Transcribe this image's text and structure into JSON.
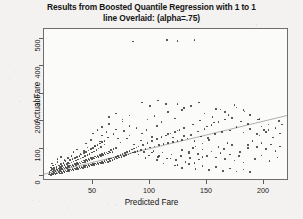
{
  "chart_data": {
    "type": "scatter",
    "title": "Results from Boosted Quantile Regression with 1 to 1 line Overlaid: (alpha=.75)",
    "title_line1": "Results from Boosted Quantile Regression with 1 to 1",
    "title_line2": "line Overlaid: (alpha=.75)",
    "xlabel": "Predicted Fare",
    "ylabel": "Actual Fare",
    "xlim": [
      7,
      222
    ],
    "ylim": [
      -18,
      535
    ],
    "xticks": [
      50,
      100,
      150,
      200
    ],
    "yticks": [
      0,
      100,
      200,
      300,
      400,
      500
    ],
    "grid": false,
    "legend": null,
    "marker_color": "#3a3a3a",
    "line_color": "#9a9a9a",
    "frame_color": "#6e6e6e",
    "background": "#fbfbfa",
    "annotations": [
      {
        "text": "1 to 1 line overlaid",
        "type": "reference-line"
      }
    ],
    "reference_line": {
      "label": "1 to 1 line",
      "x": [
        7,
        222
      ],
      "y": [
        7,
        222
      ],
      "slope": 1,
      "intercept": 0
    },
    "points": [
      [
        11,
        5
      ],
      [
        12,
        8
      ],
      [
        12,
        14
      ],
      [
        13,
        3
      ],
      [
        13,
        20
      ],
      [
        13,
        31
      ],
      [
        14,
        9
      ],
      [
        14,
        25
      ],
      [
        14,
        46
      ],
      [
        15,
        6
      ],
      [
        15,
        17
      ],
      [
        15,
        38
      ],
      [
        16,
        11
      ],
      [
        16,
        22
      ],
      [
        16,
        30
      ],
      [
        17,
        7
      ],
      [
        17,
        19
      ],
      [
        17,
        42
      ],
      [
        18,
        12
      ],
      [
        18,
        26
      ],
      [
        18,
        34
      ],
      [
        19,
        9
      ],
      [
        19,
        21
      ],
      [
        19,
        51
      ],
      [
        20,
        14
      ],
      [
        20,
        28
      ],
      [
        20,
        39
      ],
      [
        21,
        10
      ],
      [
        21,
        23
      ],
      [
        21,
        33
      ],
      [
        22,
        16
      ],
      [
        22,
        29
      ],
      [
        22,
        44
      ],
      [
        23,
        12
      ],
      [
        23,
        25
      ],
      [
        23,
        36
      ],
      [
        24,
        18
      ],
      [
        24,
        31
      ],
      [
        24,
        48
      ],
      [
        25,
        14
      ],
      [
        25,
        27
      ],
      [
        25,
        40
      ],
      [
        26,
        20
      ],
      [
        26,
        34
      ],
      [
        26,
        55
      ],
      [
        27,
        16
      ],
      [
        27,
        29
      ],
      [
        27,
        43
      ],
      [
        28,
        22
      ],
      [
        28,
        36
      ],
      [
        28,
        50
      ],
      [
        29,
        18
      ],
      [
        29,
        32
      ],
      [
        29,
        46
      ],
      [
        30,
        24
      ],
      [
        30,
        38
      ],
      [
        30,
        58
      ],
      [
        31,
        20
      ],
      [
        31,
        35
      ],
      [
        31,
        49
      ],
      [
        32,
        26
      ],
      [
        32,
        41
      ],
      [
        32,
        62
      ],
      [
        33,
        22
      ],
      [
        33,
        37
      ],
      [
        33,
        53
      ],
      [
        34,
        28
      ],
      [
        34,
        44
      ],
      [
        34,
        66
      ],
      [
        35,
        24
      ],
      [
        35,
        40
      ],
      [
        35,
        56
      ],
      [
        36,
        30
      ],
      [
        36,
        47
      ],
      [
        36,
        70
      ],
      [
        37,
        26
      ],
      [
        37,
        43
      ],
      [
        37,
        60
      ],
      [
        38,
        32
      ],
      [
        38,
        50
      ],
      [
        38,
        74
      ],
      [
        39,
        28
      ],
      [
        39,
        46
      ],
      [
        39,
        64
      ],
      [
        40,
        34
      ],
      [
        40,
        53
      ],
      [
        40,
        79
      ],
      [
        41,
        30
      ],
      [
        41,
        49
      ],
      [
        41,
        68
      ],
      [
        42,
        36
      ],
      [
        42,
        56
      ],
      [
        42,
        83
      ],
      [
        43,
        32
      ],
      [
        43,
        52
      ],
      [
        43,
        72
      ],
      [
        44,
        38
      ],
      [
        44,
        59
      ],
      [
        44,
        88
      ],
      [
        45,
        34
      ],
      [
        45,
        55
      ],
      [
        45,
        76
      ],
      [
        46,
        40
      ],
      [
        46,
        62
      ],
      [
        46,
        93
      ],
      [
        47,
        36
      ],
      [
        47,
        58
      ],
      [
        47,
        81
      ],
      [
        48,
        42
      ],
      [
        48,
        65
      ],
      [
        48,
        98
      ],
      [
        49,
        38
      ],
      [
        49,
        61
      ],
      [
        49,
        85
      ],
      [
        50,
        44
      ],
      [
        50,
        68
      ],
      [
        50,
        103
      ],
      [
        51,
        40
      ],
      [
        51,
        64
      ],
      [
        51,
        90
      ],
      [
        52,
        46
      ],
      [
        52,
        71
      ],
      [
        52,
        108
      ],
      [
        53,
        42
      ],
      [
        53,
        67
      ],
      [
        53,
        95
      ],
      [
        54,
        48
      ],
      [
        54,
        74
      ],
      [
        54,
        113
      ],
      [
        55,
        44
      ],
      [
        55,
        70
      ],
      [
        55,
        100
      ],
      [
        56,
        50
      ],
      [
        56,
        77
      ],
      [
        56,
        118
      ],
      [
        57,
        46
      ],
      [
        57,
        73
      ],
      [
        57,
        105
      ],
      [
        58,
        52
      ],
      [
        58,
        80
      ],
      [
        58,
        123
      ],
      [
        59,
        48
      ],
      [
        59,
        76
      ],
      [
        60,
        55
      ],
      [
        60,
        83
      ],
      [
        60,
        128
      ],
      [
        61,
        50
      ],
      [
        61,
        79
      ],
      [
        62,
        58
      ],
      [
        62,
        86
      ],
      [
        63,
        52
      ],
      [
        63,
        82
      ],
      [
        64,
        61
      ],
      [
        64,
        90
      ],
      [
        65,
        55
      ],
      [
        65,
        85
      ],
      [
        66,
        64
      ],
      [
        66,
        94
      ],
      [
        67,
        58
      ],
      [
        67,
        88
      ],
      [
        68,
        67
      ],
      [
        68,
        98
      ],
      [
        69,
        61
      ],
      [
        70,
        70
      ],
      [
        70,
        102
      ],
      [
        71,
        64
      ],
      [
        72,
        73
      ],
      [
        73,
        67
      ],
      [
        74,
        76
      ],
      [
        75,
        70
      ],
      [
        76,
        80
      ],
      [
        77,
        73
      ],
      [
        78,
        84
      ],
      [
        79,
        76
      ],
      [
        80,
        88
      ],
      [
        81,
        79
      ],
      [
        82,
        92
      ],
      [
        83,
        82
      ],
      [
        84,
        96
      ],
      [
        85,
        85
      ],
      [
        86,
        100
      ],
      [
        87,
        88
      ],
      [
        88,
        104
      ],
      [
        89,
        91
      ],
      [
        90,
        108
      ],
      [
        63,
        140
      ],
      [
        68,
        152
      ],
      [
        72,
        137
      ],
      [
        77,
        163
      ],
      [
        82,
        148
      ],
      [
        88,
        175
      ],
      [
        93,
        155
      ],
      [
        97,
        168
      ],
      [
        102,
        143
      ],
      [
        106,
        182
      ],
      [
        92,
        95
      ],
      [
        94,
        112
      ],
      [
        96,
        99
      ],
      [
        98,
        120
      ],
      [
        100,
        104
      ],
      [
        102,
        128
      ],
      [
        104,
        108
      ],
      [
        106,
        135
      ],
      [
        108,
        112
      ],
      [
        110,
        142
      ],
      [
        112,
        116
      ],
      [
        114,
        148
      ],
      [
        116,
        120
      ],
      [
        118,
        155
      ],
      [
        120,
        124
      ],
      [
        122,
        161
      ],
      [
        124,
        128
      ],
      [
        126,
        168
      ],
      [
        128,
        132
      ],
      [
        130,
        174
      ],
      [
        98,
        205
      ],
      [
        104,
        218
      ],
      [
        110,
        196
      ],
      [
        116,
        232
      ],
      [
        122,
        210
      ],
      [
        128,
        240
      ],
      [
        95,
        88
      ],
      [
        99,
        75
      ],
      [
        103,
        92
      ],
      [
        107,
        70
      ],
      [
        111,
        85
      ],
      [
        115,
        64
      ],
      [
        119,
        78
      ],
      [
        123,
        58
      ],
      [
        127,
        72
      ],
      [
        131,
        52
      ],
      [
        135,
        66
      ],
      [
        139,
        48
      ],
      [
        143,
        60
      ],
      [
        133,
        136
      ],
      [
        136,
        150
      ],
      [
        139,
        128
      ],
      [
        142,
        162
      ],
      [
        145,
        144
      ],
      [
        148,
        172
      ],
      [
        151,
        138
      ],
      [
        154,
        185
      ],
      [
        157,
        152
      ],
      [
        160,
        196
      ],
      [
        163,
        160
      ],
      [
        166,
        205
      ],
      [
        134,
        88
      ],
      [
        138,
        102
      ],
      [
        142,
        80
      ],
      [
        146,
        96
      ],
      [
        150,
        74
      ],
      [
        154,
        90
      ],
      [
        158,
        68
      ],
      [
        162,
        84
      ],
      [
        166,
        62
      ],
      [
        170,
        78
      ],
      [
        174,
        56
      ],
      [
        178,
        72
      ],
      [
        182,
        50
      ],
      [
        148,
        228
      ],
      [
        155,
        215
      ],
      [
        162,
        242
      ],
      [
        169,
        222
      ],
      [
        176,
        250
      ],
      [
        183,
        235
      ],
      [
        186,
        112
      ],
      [
        190,
        128
      ],
      [
        194,
        105
      ],
      [
        198,
        120
      ],
      [
        202,
        98
      ],
      [
        206,
        115
      ],
      [
        210,
        92
      ],
      [
        214,
        108
      ],
      [
        186,
        190
      ],
      [
        195,
        205
      ],
      [
        204,
        188
      ],
      [
        213,
        200
      ],
      [
        170,
        166
      ],
      [
        176,
        178
      ],
      [
        182,
        158
      ],
      [
        188,
        172
      ],
      [
        194,
        152
      ],
      [
        200,
        168
      ],
      [
        122,
        38
      ],
      [
        128,
        30
      ],
      [
        134,
        44
      ],
      [
        140,
        26
      ],
      [
        146,
        36
      ],
      [
        152,
        22
      ],
      [
        158,
        32
      ],
      [
        164,
        18
      ],
      [
        170,
        28
      ],
      [
        176,
        16
      ],
      [
        182,
        24
      ],
      [
        188,
        14
      ],
      [
        85,
        490
      ],
      [
        115,
        495
      ],
      [
        124,
        492
      ],
      [
        139,
        494
      ],
      [
        58,
        178
      ],
      [
        64,
        190
      ],
      [
        70,
        170
      ],
      [
        76,
        198
      ],
      [
        82,
        182
      ],
      [
        44,
        118
      ],
      [
        48,
        132
      ],
      [
        52,
        110
      ],
      [
        56,
        126
      ],
      [
        60,
        115
      ],
      [
        33,
        88
      ],
      [
        36,
        96
      ],
      [
        39,
        80
      ],
      [
        42,
        92
      ],
      [
        45,
        104
      ],
      [
        19,
        62
      ],
      [
        22,
        70
      ],
      [
        25,
        58
      ],
      [
        28,
        66
      ],
      [
        31,
        74
      ],
      [
        93,
        268
      ],
      [
        100,
        255
      ],
      [
        107,
        275
      ],
      [
        114,
        262
      ],
      [
        146,
        118
      ],
      [
        152,
        132
      ],
      [
        160,
        105
      ],
      [
        168,
        120
      ],
      [
        128,
        95
      ],
      [
        134,
        82
      ],
      [
        140,
        108
      ],
      [
        146,
        70
      ],
      [
        196,
        148
      ],
      [
        202,
        160
      ],
      [
        208,
        140
      ],
      [
        214,
        155
      ],
      [
        172,
        212
      ],
      [
        180,
        198
      ],
      [
        188,
        222
      ],
      [
        196,
        208
      ],
      [
        106,
        58
      ],
      [
        112,
        46
      ],
      [
        118,
        64
      ],
      [
        124,
        40
      ],
      [
        74,
        122
      ],
      [
        80,
        136
      ],
      [
        86,
        115
      ],
      [
        92,
        130
      ],
      [
        158,
        245
      ],
      [
        166,
        232
      ],
      [
        174,
        258
      ],
      [
        182,
        240
      ],
      [
        138,
        188
      ],
      [
        144,
        202
      ],
      [
        150,
        180
      ],
      [
        156,
        195
      ],
      [
        64,
        215
      ],
      [
        70,
        228
      ],
      [
        76,
        205
      ],
      [
        82,
        220
      ],
      [
        210,
        175
      ],
      [
        216,
        188
      ],
      [
        204,
        168
      ],
      [
        198,
        180
      ],
      [
        116,
        152
      ],
      [
        120,
        140
      ],
      [
        124,
        165
      ],
      [
        130,
        145
      ],
      [
        50,
        155
      ],
      [
        54,
        168
      ],
      [
        58,
        148
      ],
      [
        62,
        160
      ],
      [
        90,
        78
      ],
      [
        96,
        65
      ],
      [
        102,
        85
      ],
      [
        108,
        72
      ],
      [
        165,
        98
      ],
      [
        172,
        112
      ],
      [
        179,
        88
      ],
      [
        186,
        102
      ],
      [
        192,
        62
      ],
      [
        198,
        75
      ],
      [
        205,
        55
      ],
      [
        212,
        68
      ],
      [
        136,
        255
      ],
      [
        143,
        268
      ],
      [
        130,
        248
      ],
      [
        124,
        262
      ]
    ]
  },
  "axes": {
    "y_tick_labels": [
      "0",
      "100",
      "200",
      "300",
      "400",
      "500"
    ],
    "x_tick_labels": [
      "50",
      "100",
      "150",
      "200"
    ]
  }
}
